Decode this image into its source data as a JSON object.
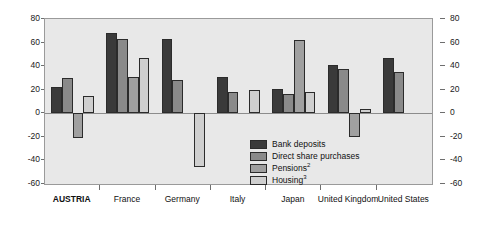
{
  "chart_data": {
    "type": "bar",
    "title": "",
    "subtitle": "",
    "xlabel": "",
    "ylabel": "",
    "ylim": [
      -60,
      80
    ],
    "yticks": [
      80,
      60,
      40,
      20,
      0,
      -20,
      -40,
      -60
    ],
    "ytick_labels": [
      "80",
      "60",
      "40",
      "20",
      "0",
      "-20",
      "-40",
      "-60"
    ],
    "right_axis": true,
    "grid": false,
    "legend_position": "inside-center-below-zero",
    "categories": [
      "AUSTRIA",
      "France",
      "Germany",
      "Italy",
      "Japan",
      "United Kingdom",
      "United States"
    ],
    "highlighted_category": "AUSTRIA",
    "series": [
      {
        "name": "Bank deposits",
        "color": "#3a3a3a",
        "values": [
          22,
          68,
          63,
          31,
          21,
          41,
          47
        ]
      },
      {
        "name": "Direct share purchases",
        "color": "#8a8a8a",
        "values": [
          30,
          63,
          28,
          18,
          16,
          38,
          35
        ]
      },
      {
        "name": "Pensions",
        "superscript": "2",
        "color": "#a0a0a0",
        "values": [
          -21,
          31,
          null,
          null,
          62,
          -20,
          null
        ]
      },
      {
        "name": "Housing",
        "superscript": "3",
        "color": "#cfcfcf",
        "values": [
          15,
          47,
          -46,
          20,
          18,
          3.5,
          null
        ]
      }
    ]
  },
  "legend": {
    "items": [
      {
        "label": "Bank deposits",
        "superscript": "",
        "color": "#3a3a3a"
      },
      {
        "label": "Direct share purchases",
        "superscript": "",
        "color": "#8a8a8a"
      },
      {
        "label": "Pensions",
        "superscript": "2",
        "color": "#a0a0a0"
      },
      {
        "label": "Housing",
        "superscript": "3",
        "color": "#cfcfcf"
      }
    ]
  },
  "colors": {
    "plot_background": "#e8e8e8",
    "page_background": "#ffffff",
    "frame_border": "#9a9a9a",
    "zero_line": "#8c8c8c",
    "bar_outline": "#2b2b2b",
    "text": "#111111"
  }
}
